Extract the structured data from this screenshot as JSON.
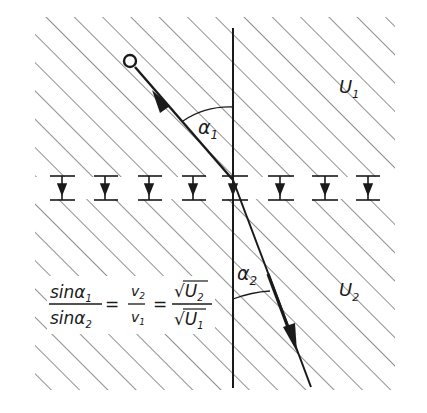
{
  "diagram": {
    "type": "electron refraction at potential boundary",
    "regions": [
      {
        "id": "region-1",
        "label": "U",
        "subscript": "1"
      },
      {
        "id": "region-2",
        "label": "U",
        "subscript": "2"
      }
    ],
    "angles": [
      {
        "id": "angle-1",
        "label": "α",
        "subscript": "1"
      },
      {
        "id": "angle-2",
        "label": "α",
        "subscript": "2"
      }
    ],
    "formula": {
      "lhs_num": "sinα",
      "lhs_num_sub": "1",
      "lhs_den": "sinα",
      "lhs_den_sub": "2",
      "mid_num": "v",
      "mid_num_sub": "2",
      "mid_den": "v",
      "mid_den_sub": "1",
      "rhs_num": "√U",
      "rhs_num_sub": "2",
      "rhs_den": "√U",
      "rhs_den_sub": "1",
      "equals": "="
    },
    "field_markers_count": 8,
    "colors": {
      "ink": "#1a1a1a",
      "hatch": "#555555",
      "background": "#ffffff"
    }
  }
}
